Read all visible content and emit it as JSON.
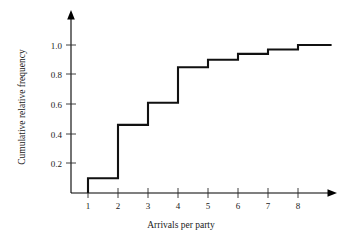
{
  "chart_data": {
    "type": "line",
    "subtype": "step-ecdf",
    "title": "",
    "xlabel": "Arrivals per party",
    "ylabel": "Cumulative relative frequency",
    "x": [
      1,
      2,
      3,
      4,
      5,
      6,
      7,
      8
    ],
    "values": [
      0.1,
      0.46,
      0.61,
      0.85,
      0.9,
      0.94,
      0.97,
      1.0
    ],
    "categories": [
      "1",
      "2",
      "3",
      "4",
      "5",
      "6",
      "7",
      "8"
    ],
    "xticks": [
      1,
      2,
      3,
      4,
      5,
      6,
      7,
      8
    ],
    "xtick_labels": [
      "1",
      "2",
      "3",
      "4",
      "5",
      "6",
      "7",
      "8"
    ],
    "yticks": [
      0.2,
      0.4,
      0.6,
      0.8,
      1.0
    ],
    "ytick_labels": [
      "0.2",
      "0.4",
      "0.6",
      "0.8",
      "1.0"
    ],
    "xlim": [
      0.2,
      9.2
    ],
    "ylim": [
      0.0,
      1.06
    ],
    "grid": false,
    "legend": false,
    "legend_position": "none",
    "line_color": "#111111",
    "axis_color": "#000000",
    "background_color": "#ffffff",
    "annotations": []
  },
  "figure": {
    "xaxis_title": "Arrivals per party",
    "yaxis_title": "Cumulative relative frequency",
    "ytick_0": "0.2",
    "ytick_1": "0.4",
    "ytick_2": "0.6",
    "ytick_3": "0.8",
    "ytick_4": "1.0",
    "xtick_0": "1",
    "xtick_1": "2",
    "xtick_2": "3",
    "xtick_3": "4",
    "xtick_4": "5",
    "xtick_5": "6",
    "xtick_6": "7",
    "xtick_7": "8"
  }
}
